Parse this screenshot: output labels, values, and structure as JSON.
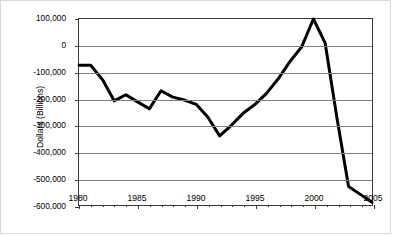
{
  "chart_data": {
    "type": "line",
    "title": "",
    "xlabel": "",
    "ylabel": "Dollars (Billions)",
    "xlim": [
      1980,
      2005
    ],
    "ylim": [
      -600000,
      100000
    ],
    "grid": true,
    "legend": "none",
    "y_ticks": [
      100000,
      0,
      -100000,
      -200000,
      -300000,
      -400000,
      -500000,
      -600000
    ],
    "y_tick_labels": [
      "100,000",
      "0",
      "-100,000",
      "-200,000",
      "-300,000",
      "-400,000",
      "-500,000",
      "-600,000"
    ],
    "x_ticks_major": [
      1980,
      1985,
      1990,
      1995,
      2000,
      2005
    ],
    "x_tick_labels": [
      "1980",
      "1985",
      "1990",
      "1995",
      "2000",
      "2005"
    ],
    "x_ticks_minor": [
      1981,
      1982,
      1983,
      1984,
      1986,
      1987,
      1988,
      1989,
      1991,
      1992,
      1993,
      1994,
      1996,
      1997,
      1998,
      1999,
      2001,
      2002,
      2003,
      2004
    ],
    "x": [
      1980,
      1981,
      1982,
      1983,
      1984,
      1985,
      1986,
      1987,
      1988,
      1989,
      1990,
      1991,
      1992,
      1993,
      1994,
      1995,
      1996,
      1997,
      1998,
      1999,
      2000,
      2001,
      2002,
      2003,
      2004,
      2005
    ],
    "series": [
      {
        "name": "Budget Surplus/Deficit",
        "color": "#000000",
        "line_width": 3,
        "values": [
          -74000,
          -74000,
          -128000,
          -208000,
          -185000,
          -212000,
          -238000,
          -170000,
          -194000,
          -205000,
          -221000,
          -270000,
          -340000,
          -300000,
          -255000,
          -222000,
          -180000,
          -125000,
          -60000,
          -5000,
          100000,
          10000,
          -270000,
          -530000,
          -560000,
          -590000
        ]
      }
    ]
  }
}
